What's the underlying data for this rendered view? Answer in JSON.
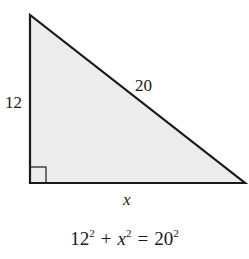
{
  "diagram": {
    "type": "right-triangle",
    "fill_color": "#ececec",
    "stroke_color": "#1a1a1a",
    "vertices": {
      "top": [
        30,
        15
      ],
      "right_angle": [
        30,
        183
      ],
      "right": [
        245,
        183
      ]
    },
    "labels": {
      "vertical_leg": "12",
      "hypotenuse": "20",
      "horizontal_leg": "x"
    },
    "right_angle_marker": true
  },
  "equation": {
    "term1_base": "12",
    "term1_exp": "2",
    "plus": "+",
    "term2_base": "x",
    "term2_exp": "2",
    "equals": "=",
    "term3_base": "20",
    "term3_exp": "2"
  }
}
